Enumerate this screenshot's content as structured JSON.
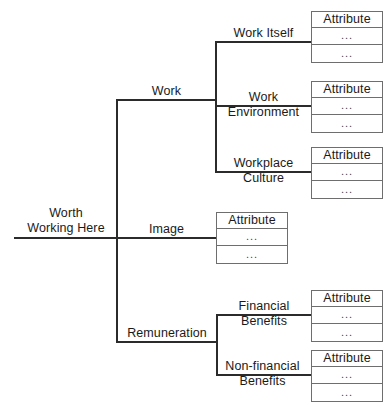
{
  "diagram": {
    "type": "hierarchical-tree",
    "line_color": "#2b2b2b",
    "box_border_color": "#6e6e6e",
    "text_color": "#1a1a1a",
    "background": "#ffffff",
    "root": {
      "id": "worth-working-here",
      "label_line1": "Worth",
      "label_line2": "Working Here"
    },
    "branches": [
      {
        "id": "work",
        "label_line1": "Work",
        "label_line2": "",
        "children": [
          {
            "id": "work-itself",
            "label_line1": "Work Itself",
            "label_line2": "",
            "attribute_box": {
              "header": "Attribute",
              "rows": [
                "...",
                "..."
              ]
            }
          },
          {
            "id": "work-environment",
            "label_line1": "Work",
            "label_line2": "Environment",
            "attribute_box": {
              "header": "Attribute",
              "rows": [
                "...",
                "..."
              ]
            }
          },
          {
            "id": "workplace-culture",
            "label_line1": "Workplace",
            "label_line2": "Culture",
            "attribute_box": {
              "header": "Attribute",
              "rows": [
                "...",
                "..."
              ]
            }
          }
        ]
      },
      {
        "id": "image",
        "label_line1": "Image",
        "label_line2": "",
        "attribute_box": {
          "header": "Attribute",
          "rows": [
            "...",
            "..."
          ]
        },
        "children": []
      },
      {
        "id": "remuneration",
        "label_line1": "Remuneration",
        "label_line2": "",
        "children": [
          {
            "id": "financial-benefits",
            "label_line1": "Financial",
            "label_line2": "Benefits",
            "attribute_box": {
              "header": "Attribute",
              "rows": [
                "...",
                "..."
              ]
            }
          },
          {
            "id": "non-financial-benefits",
            "label_line1": "Non-financial",
            "label_line2": "Benefits",
            "attribute_box": {
              "header": "Attribute",
              "rows": [
                "...",
                "..."
              ]
            }
          }
        ]
      }
    ]
  }
}
